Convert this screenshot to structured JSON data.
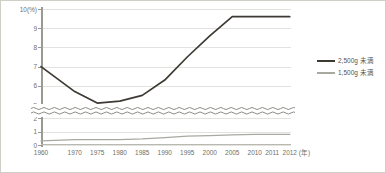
{
  "chart_data": {
    "type": "line",
    "title": "",
    "subtitle": "",
    "xlabel": "年",
    "ylabel": "%",
    "y_axis_unit_label": "10(%)",
    "x": [
      "1960",
      "1970",
      "1975",
      "1980",
      "1985",
      "1990",
      "1995",
      "2000",
      "2005",
      "2010",
      "2011",
      "2012"
    ],
    "categories": [
      "1960",
      "1970",
      "1975",
      "1980",
      "1985",
      "1990",
      "1995",
      "2000",
      "2005",
      "2010",
      "2011",
      "2012"
    ],
    "yticks_upper": [
      "5",
      "6",
      "7",
      "8",
      "9",
      "10(%)"
    ],
    "yticks_lower": [
      "0",
      "1",
      "2"
    ],
    "ylim_upper": [
      5,
      10
    ],
    "ylim_lower": [
      0,
      2
    ],
    "axis_break": true,
    "axis_break_style": "wavy",
    "grid": true,
    "grid_axis": "y",
    "legend_position": "right",
    "series": [
      {
        "name": "2,500g 未満",
        "color": "#3d3a33",
        "values": [
          7.0,
          5.7,
          5.1,
          5.2,
          5.5,
          6.3,
          7.5,
          8.6,
          9.6,
          9.6,
          9.6,
          9.6
        ]
      },
      {
        "name": "1,500g 未満",
        "color": "#a9a9a1",
        "values": [
          0.3,
          0.4,
          0.4,
          0.4,
          0.45,
          0.55,
          0.65,
          0.7,
          0.75,
          0.78,
          0.78,
          0.78
        ]
      }
    ]
  },
  "axis": {
    "x_unit": "(年)",
    "y_unit": "(%)"
  },
  "legend": {
    "items": [
      {
        "label": "2,500g 未満",
        "color": "#3d3a33"
      },
      {
        "label": "1,500g 未満",
        "color": "#a9a9a1"
      }
    ]
  },
  "colors": {
    "series_dark": "#3d3a33",
    "series_light": "#a9a9a1",
    "gridline": "#e2e2de",
    "axis": "#9a9a93",
    "border": "#cfcfc8",
    "text": "#6f6f68",
    "background": "#ffffff"
  }
}
